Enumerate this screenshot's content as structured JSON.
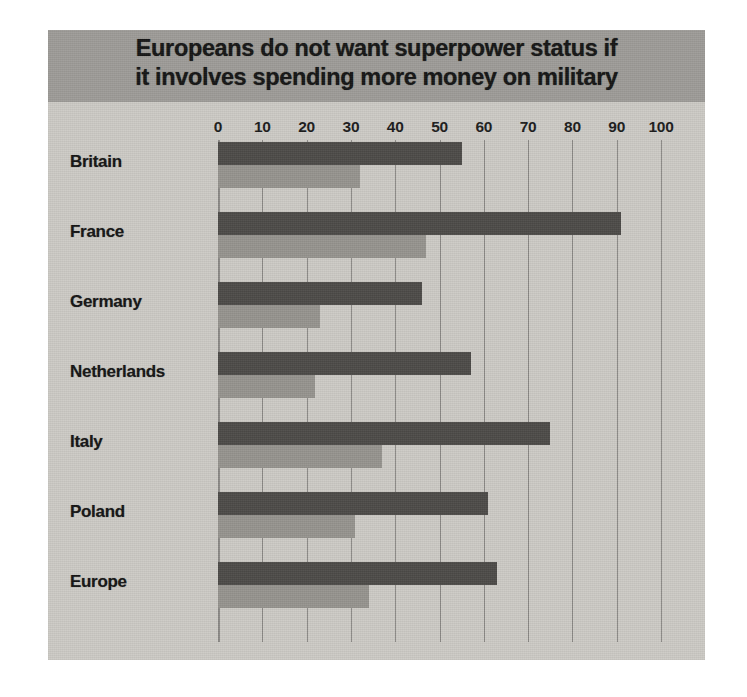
{
  "chart_data": {
    "type": "bar",
    "orientation": "horizontal",
    "title": "Europeans do not want superpower status if it involves spending more money on military",
    "title_line1": "Europeans do not want superpower status if",
    "title_line2": "it involves spending more money on military",
    "xlabel": "",
    "ylabel": "",
    "xlim": [
      0,
      100
    ],
    "xticks": [
      0,
      10,
      20,
      30,
      40,
      50,
      60,
      70,
      80,
      90,
      100
    ],
    "xtick_labels": [
      "0",
      "10",
      "20",
      "30",
      "40",
      "50",
      "60",
      "70",
      "80",
      "90",
      "100"
    ],
    "grid": true,
    "grid_axis": "x",
    "legend_position": "bottom",
    "categories": [
      "Britain",
      "France",
      "Germany",
      "Netherlands",
      "Italy",
      "Poland",
      "Europe"
    ],
    "series": [
      {
        "name": "EU should become a superpower",
        "color": "#4d4b48",
        "values": [
          55,
          91,
          46,
          57,
          75,
          61,
          63
        ]
      },
      {
        "name": "Even if countries have to spend more on military",
        "color": "#96948f",
        "values": [
          32,
          47,
          23,
          22,
          37,
          31,
          34
        ]
      }
    ]
  },
  "figure": {
    "background_color": "#cdcbc6",
    "title_band_color": "#9e9c98",
    "gridline_color": "#8c8a86",
    "text_color": "#141414"
  },
  "legend": {
    "items": [
      {
        "label": "EU should become a superpower",
        "color": "#4d4b48"
      },
      {
        "label": "Even if countries have to spend more on military",
        "color": "#96948f"
      }
    ]
  }
}
